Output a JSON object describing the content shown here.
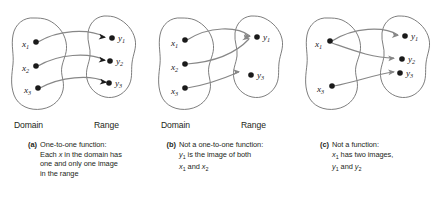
{
  "figure": {
    "colors": {
      "blob_stroke": "#6f6f6f",
      "arrow_stroke": "#878787",
      "dot_fill": "#1a1a1a",
      "text": "#231f20",
      "background": "#ffffff"
    }
  },
  "panels": [
    {
      "id": "a",
      "tag": "(a)",
      "venn": {
        "domain_label": "Domain",
        "range_label": "Range",
        "show_set_labels": true
      },
      "domain_points": [
        "x1",
        "x2",
        "x3"
      ],
      "range_points": [
        "y1",
        "y2",
        "y3"
      ],
      "mappings": [
        {
          "from": "x1",
          "to": "y1"
        },
        {
          "from": "x2",
          "to": "y2"
        },
        {
          "from": "x3",
          "to": "y3"
        }
      ],
      "caption_lines": [
        "One-to-one function:",
        "Each x in the domain has",
        "one and only one image",
        "in the range"
      ]
    },
    {
      "id": "b",
      "tag": "(b)",
      "venn": {
        "domain_label": "Domain",
        "range_label": "Range",
        "show_set_labels": true
      },
      "domain_points": [
        "x1",
        "x2",
        "x3"
      ],
      "range_points": [
        "y1",
        "y3"
      ],
      "mappings": [
        {
          "from": "x1",
          "to": "y1"
        },
        {
          "from": "x2",
          "to": "y1"
        },
        {
          "from": "x3",
          "to": "y3"
        }
      ],
      "caption_lines": [
        "Not a one-to-one function:",
        "y1 is the image of both",
        "x1 and x2"
      ]
    },
    {
      "id": "c",
      "tag": "(c)",
      "venn": {
        "domain_label": "",
        "range_label": "",
        "show_set_labels": false
      },
      "domain_points": [
        "x1",
        "x3"
      ],
      "range_points": [
        "y1",
        "y2",
        "y3"
      ],
      "mappings": [
        {
          "from": "x1",
          "to": "y1"
        },
        {
          "from": "x1",
          "to": "y2"
        },
        {
          "from": "x3",
          "to": "y3"
        }
      ],
      "caption_lines": [
        "Not a function:",
        "x1 has two images,",
        "y1 and y2"
      ]
    }
  ],
  "labels": {
    "x1": "x",
    "x1_sub": "1",
    "x2": "x",
    "x2_sub": "2",
    "x3": "x",
    "x3_sub": "3",
    "y1": "y",
    "y1_sub": "1",
    "y2": "y",
    "y2_sub": "2",
    "y3": "y",
    "y3_sub": "3"
  }
}
